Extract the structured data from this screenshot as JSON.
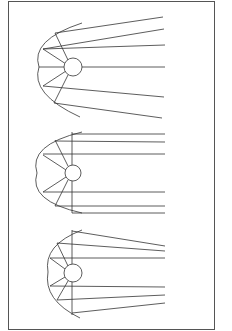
{
  "figure": {
    "stroke_color": "#333333",
    "border_color": "#555555",
    "background": "#ffffff"
  },
  "diagrams": [
    {
      "name": "diverging-reflector",
      "source": {
        "cx": 73,
        "cy": 67,
        "r": 9
      },
      "reflector_arc": "M 82 23 Q 30 40 39 67 Q 30 94 80 117",
      "axis_line": null,
      "spokes": [
        [
          68,
          60,
          55,
          33
        ],
        [
          66,
          64,
          43,
          49
        ],
        [
          64,
          67,
          39,
          67
        ],
        [
          66,
          71,
          43,
          86
        ],
        [
          68,
          75,
          54,
          103
        ]
      ],
      "rays": [
        [
          55,
          33,
          163,
          17
        ],
        [
          43,
          49,
          164,
          29
        ],
        [
          43,
          49,
          165,
          45
        ],
        [
          82,
          67,
          165,
          67
        ],
        [
          43,
          86,
          164,
          97
        ],
        [
          54,
          103,
          162,
          118
        ]
      ]
    },
    {
      "name": "parallel-reflector",
      "source": {
        "cx": 73,
        "cy": 173,
        "r": 8
      },
      "reflector_arc": "M 82 132 Q 28 145 37 173 Q 28 201 82 213",
      "axis_line": [
        72,
        132,
        72,
        213
      ],
      "spokes": [
        [
          68,
          166,
          55,
          140
        ],
        [
          66,
          170,
          43,
          155
        ],
        [
          66,
          177,
          43,
          192
        ],
        [
          68,
          180,
          55,
          206
        ]
      ],
      "rays": [
        [
          72,
          134,
          165,
          134
        ],
        [
          55,
          141,
          165,
          142
        ],
        [
          43,
          154,
          165,
          154
        ],
        [
          43,
          192,
          165,
          192
        ],
        [
          55,
          206,
          165,
          206
        ],
        [
          72,
          213,
          165,
          213
        ]
      ]
    },
    {
      "name": "converging-reflector",
      "source": {
        "cx": 73,
        "cy": 273,
        "r": 9
      },
      "reflector_arc": "M 82 230 Q 43 245 48 272 Q 43 300 80 318",
      "axis_line": [
        72,
        230,
        72,
        315
      ],
      "spokes": [
        [
          68,
          266,
          57,
          243
        ],
        [
          65,
          269,
          50,
          258
        ],
        [
          65,
          277,
          50,
          286
        ],
        [
          68,
          281,
          57,
          300
        ]
      ],
      "rays": [
        [
          72,
          231,
          165,
          246
        ],
        [
          57,
          243,
          165,
          251
        ],
        [
          50,
          258,
          165,
          258
        ],
        [
          50,
          286,
          165,
          287
        ],
        [
          57,
          300,
          165,
          295
        ],
        [
          72,
          313,
          165,
          303
        ]
      ]
    }
  ]
}
